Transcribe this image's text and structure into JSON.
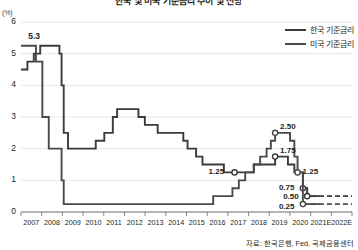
{
  "title": "한국 및 미국 기준금리 추이 및 전망",
  "axis_unit": "(%)",
  "legend": {
    "items": [
      {
        "label": "한국 기준금리",
        "key": "korea"
      },
      {
        "label": "미국 기준금리",
        "key": "us"
      }
    ]
  },
  "source": "자료: 한국은행, Fed, 국제금융센터",
  "colors": {
    "korea_line": "#3b3b3b",
    "us_line": "#4a4a4a",
    "gridline": "#e0e0e0",
    "axis": "#6d6d6d",
    "text": "#231f20",
    "background": "#ffffff"
  },
  "peak_label": "5.3",
  "chart_data": {
    "type": "line",
    "title": "한국 및 미국 기준금리 추이 및 전망",
    "xlabel": "",
    "ylabel": "(%)",
    "ylim": [
      0,
      6
    ],
    "yticks": [
      0,
      1,
      2,
      3,
      4,
      5,
      6
    ],
    "ytick_labels": [
      "0",
      "1",
      "2",
      "3",
      "4",
      "5",
      "6"
    ],
    "grid": true,
    "legend_position": "top-right",
    "xtick_labels": [
      "2007",
      "2008",
      "2009",
      "2010",
      "2011",
      "2012",
      "2013",
      "2014",
      "2015",
      "2016",
      "2017",
      "2018",
      "2019",
      "2020",
      "2021E",
      "2022E"
    ],
    "xlim": [
      2007,
      2022.5
    ],
    "forecast_start": 2021,
    "series": [
      {
        "name": "한국 기준금리",
        "key": "korea",
        "style": "step",
        "points": [
          [
            2007.0,
            4.5
          ],
          [
            2007.3,
            4.75
          ],
          [
            2007.6,
            5.0
          ],
          [
            2007.9,
            5.25
          ],
          [
            2008.0,
            5.25
          ],
          [
            2008.6,
            5.25
          ],
          [
            2008.8,
            5.0
          ],
          [
            2008.9,
            4.0
          ],
          [
            2009.0,
            2.5
          ],
          [
            2009.2,
            2.0
          ],
          [
            2009.5,
            2.0
          ],
          [
            2010.0,
            2.0
          ],
          [
            2010.5,
            2.25
          ],
          [
            2010.9,
            2.5
          ],
          [
            2011.3,
            3.0
          ],
          [
            2011.5,
            3.25
          ],
          [
            2012.0,
            3.25
          ],
          [
            2012.5,
            3.0
          ],
          [
            2012.8,
            2.75
          ],
          [
            2013.4,
            2.5
          ],
          [
            2014.0,
            2.5
          ],
          [
            2014.6,
            2.25
          ],
          [
            2014.8,
            2.0
          ],
          [
            2015.2,
            1.75
          ],
          [
            2015.5,
            1.5
          ],
          [
            2016.5,
            1.25
          ],
          [
            2017.0,
            1.25
          ],
          [
            2017.9,
            1.5
          ],
          [
            2018.9,
            1.75
          ],
          [
            2019.5,
            1.5
          ],
          [
            2019.8,
            1.25
          ],
          [
            2020.2,
            0.75
          ],
          [
            2020.4,
            0.5
          ],
          [
            2021.0,
            0.5
          ],
          [
            2022.5,
            0.5
          ]
        ],
        "labeled_points": [
          {
            "x": 2017.0,
            "y": 1.25,
            "text": "1.25"
          },
          {
            "x": 2018.9,
            "y": 1.75,
            "text": "1.75"
          },
          {
            "x": 2020.2,
            "y": 0.75,
            "text": "0.75"
          },
          {
            "x": 2020.4,
            "y": 0.5,
            "text": "0.50"
          }
        ]
      },
      {
        "name": "미국 기준금리",
        "key": "us",
        "style": "step",
        "points": [
          [
            2007.0,
            5.25
          ],
          [
            2007.6,
            5.25
          ],
          [
            2007.7,
            4.75
          ],
          [
            2008.0,
            3.0
          ],
          [
            2008.3,
            2.0
          ],
          [
            2008.7,
            2.0
          ],
          [
            2008.9,
            1.0
          ],
          [
            2009.0,
            0.25
          ],
          [
            2010.0,
            0.25
          ],
          [
            2012.0,
            0.25
          ],
          [
            2014.0,
            0.25
          ],
          [
            2015.9,
            0.25
          ],
          [
            2016.0,
            0.5
          ],
          [
            2016.9,
            0.75
          ],
          [
            2017.2,
            1.0
          ],
          [
            2017.5,
            1.25
          ],
          [
            2017.9,
            1.5
          ],
          [
            2018.2,
            1.75
          ],
          [
            2018.5,
            2.0
          ],
          [
            2018.7,
            2.25
          ],
          [
            2018.9,
            2.5
          ],
          [
            2019.4,
            2.5
          ],
          [
            2019.6,
            2.25
          ],
          [
            2019.8,
            1.75
          ],
          [
            2019.95,
            1.25
          ],
          [
            2020.2,
            0.25
          ],
          [
            2021.0,
            0.25
          ],
          [
            2022.5,
            0.25
          ]
        ],
        "labeled_points": [
          {
            "x": 2018.9,
            "y": 2.5,
            "text": "2.50"
          },
          {
            "x": 2019.95,
            "y": 1.25,
            "text": "1.25"
          },
          {
            "x": 2020.2,
            "y": 0.25,
            "text": "0.25"
          }
        ]
      }
    ],
    "annotations": [
      {
        "text": "5.3",
        "x": 2007.9,
        "y": 5.3,
        "note": "peak"
      }
    ]
  }
}
